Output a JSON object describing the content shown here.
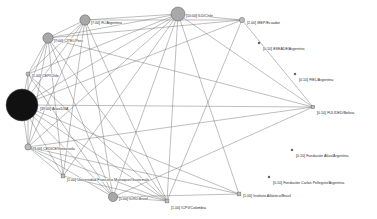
{
  "figure": {
    "title": "",
    "background_color": "#ffffff",
    "edge_color": "#6e6e6e",
    "node_fill_large": "#111111",
    "node_fill_medium": "#a8a8a8",
    "node_fill_small": "#bdbdbd",
    "node_stroke": "#5a5a5a",
    "label_color": "#2b2b2b"
  },
  "chart_data": {
    "type": "network",
    "title": "",
    "xlabel": "",
    "ylabel": "",
    "grid": false,
    "legend": "none",
    "node_size_metric": "weight",
    "nodes": [
      {
        "id": "atlas_usa",
        "label": "[39.00] Atlas/USA",
        "weight": 39.0,
        "x": 22,
        "y": 105,
        "r": 16.0,
        "shape": "circle",
        "fill": "#111111",
        "label_dx": 18,
        "label_dy": 5,
        "connected": true
      },
      {
        "id": "ild_chile",
        "label": "[10.00] ILD/Chile",
        "weight": 10.0,
        "x": 178,
        "y": 14,
        "r": 7.0,
        "shape": "circle",
        "fill": "#a8a8a8",
        "label_dx": 8,
        "label_dy": 2.5,
        "connected": true
      },
      {
        "id": "fl_argentina",
        "label": "[7.00] FL/Argentina",
        "weight": 7.0,
        "x": 85,
        "y": 20,
        "r": 5.2,
        "shape": "circle",
        "fill": "#a8a8a8",
        "label_dx": 6,
        "label_dy": 3.5,
        "connected": true
      },
      {
        "id": "citel_peru",
        "label": "[7.00] CITEL/Perú",
        "weight": 7.0,
        "x": 48,
        "y": 38,
        "r": 5.2,
        "shape": "circle",
        "fill": "#a8a8a8",
        "label_dx": 6,
        "label_dy": 3.5,
        "connected": true
      },
      {
        "id": "il_rj_brasil",
        "label": "[5.00] IL/RJ-Brasil",
        "weight": 5.0,
        "x": 113,
        "y": 197,
        "r": 4.6,
        "shape": "circle",
        "fill": "#a8a8a8",
        "label_dx": 6,
        "label_dy": 3.0,
        "connected": true
      },
      {
        "id": "cedice_ven",
        "label": "[3.00] CEDICE/Venezuela",
        "weight": 3.0,
        "x": 28,
        "y": 147,
        "r": 3.1,
        "shape": "circle",
        "fill": "#bdbdbd",
        "label_dx": 5,
        "label_dy": 3.0,
        "connected": true
      },
      {
        "id": "ieep_ecuador",
        "label": "[2.00] IEEP/Ecuador",
        "weight": 2.0,
        "x": 242,
        "y": 20,
        "r": 2.6,
        "shape": "circle",
        "fill": "#bdbdbd",
        "label_dx": 5,
        "label_dy": 4.0,
        "connected": true
      },
      {
        "id": "cep_chile",
        "label": "[1.00] CEP/Chile",
        "weight": 1.0,
        "x": 28,
        "y": 74,
        "r": 2.0,
        "shape": "circle",
        "fill": "#bdbdbd",
        "label_dx": 4,
        "label_dy": 3.0,
        "connected": true
      },
      {
        "id": "ufm_guatemala",
        "label": "[1.00] Universidad Francisco Marroquin/Guatemala",
        "weight": 1.0,
        "x": 63,
        "y": 176,
        "r": 1.9,
        "shape": "square",
        "fill": "#bdbdbd",
        "label_dx": 4,
        "label_dy": 4.5,
        "connected": true
      },
      {
        "id": "icpv_colombia",
        "label": "[1.00] ICPV/Colombia",
        "weight": 1.0,
        "x": 167,
        "y": 201,
        "r": 1.9,
        "shape": "square",
        "fill": "#bdbdbd",
        "label_dx": 4,
        "label_dy": 8.0,
        "connected": true
      },
      {
        "id": "inst_atl_bra",
        "label": "[1.00] Instituto Atlántico/Brasil",
        "weight": 1.0,
        "x": 239,
        "y": 194,
        "r": 1.9,
        "shape": "square",
        "fill": "#bdbdbd",
        "label_dx": 4,
        "label_dy": 3.0,
        "connected": true
      },
      {
        "id": "fulided_bol",
        "label": "[0.10] FULIDED/Bolivia",
        "weight": 0.1,
        "x": 313,
        "y": 107,
        "r": 1.7,
        "shape": "square",
        "fill": "#bdbdbd",
        "label_dx": 4,
        "label_dy": 6.5,
        "connected": true
      },
      {
        "id": "eseade_arg",
        "label": "[0.10] ESEADE/Argentina",
        "weight": 0.1,
        "x": 259,
        "y": 43,
        "r": 0.9,
        "shape": "square",
        "fill": "#555555",
        "label_dx": 4,
        "label_dy": 6.5,
        "connected": false
      },
      {
        "id": "fiel_arg",
        "label": "[0.10] FIEL/Argentina",
        "weight": 0.1,
        "x": 295,
        "y": 74,
        "r": 0.9,
        "shape": "square",
        "fill": "#555555",
        "label_dx": 4,
        "label_dy": 6.5,
        "connected": false
      },
      {
        "id": "fund_atlas_arg",
        "label": "[0.10] Fundación Atlas/Argentina",
        "weight": 0.1,
        "x": 292,
        "y": 150,
        "r": 0.9,
        "shape": "square",
        "fill": "#555555",
        "label_dx": 4,
        "label_dy": 6.5,
        "connected": false
      },
      {
        "id": "fund_carlos",
        "label": "[0.10] Fundación Carlos Pellegrini/Argentina",
        "weight": 0.1,
        "x": 269,
        "y": 177,
        "r": 0.9,
        "shape": "square",
        "fill": "#555555",
        "label_dx": 4,
        "label_dy": 6.5,
        "connected": false
      }
    ],
    "edges": [
      {
        "source": "atlas_usa",
        "target": "ild_chile"
      },
      {
        "source": "atlas_usa",
        "target": "fl_argentina"
      },
      {
        "source": "atlas_usa",
        "target": "citel_peru"
      },
      {
        "source": "atlas_usa",
        "target": "cep_chile"
      },
      {
        "source": "atlas_usa",
        "target": "cedice_ven"
      },
      {
        "source": "atlas_usa",
        "target": "il_rj_brasil"
      },
      {
        "source": "atlas_usa",
        "target": "ufm_guatemala"
      },
      {
        "source": "atlas_usa",
        "target": "icpv_colombia"
      },
      {
        "source": "atlas_usa",
        "target": "inst_atl_bra"
      },
      {
        "source": "atlas_usa",
        "target": "fulided_bol"
      },
      {
        "source": "atlas_usa",
        "target": "ieep_ecuador"
      },
      {
        "source": "ild_chile",
        "target": "fl_argentina"
      },
      {
        "source": "ild_chile",
        "target": "citel_peru"
      },
      {
        "source": "ild_chile",
        "target": "cep_chile"
      },
      {
        "source": "ild_chile",
        "target": "cedice_ven"
      },
      {
        "source": "ild_chile",
        "target": "il_rj_brasil"
      },
      {
        "source": "ild_chile",
        "target": "ufm_guatemala"
      },
      {
        "source": "ild_chile",
        "target": "icpv_colombia"
      },
      {
        "source": "ild_chile",
        "target": "inst_atl_bra"
      },
      {
        "source": "ild_chile",
        "target": "fulided_bol"
      },
      {
        "source": "ild_chile",
        "target": "ieep_ecuador"
      },
      {
        "source": "fl_argentina",
        "target": "citel_peru"
      },
      {
        "source": "fl_argentina",
        "target": "cep_chile"
      },
      {
        "source": "fl_argentina",
        "target": "cedice_ven"
      },
      {
        "source": "fl_argentina",
        "target": "il_rj_brasil"
      },
      {
        "source": "fl_argentina",
        "target": "ufm_guatemala"
      },
      {
        "source": "fl_argentina",
        "target": "icpv_colombia"
      },
      {
        "source": "fl_argentina",
        "target": "ieep_ecuador"
      },
      {
        "source": "citel_peru",
        "target": "cep_chile"
      },
      {
        "source": "citel_peru",
        "target": "cedice_ven"
      },
      {
        "source": "citel_peru",
        "target": "il_rj_brasil"
      },
      {
        "source": "citel_peru",
        "target": "ufm_guatemala"
      },
      {
        "source": "citel_peru",
        "target": "icpv_colombia"
      },
      {
        "source": "citel_peru",
        "target": "ieep_ecuador"
      },
      {
        "source": "citel_peru",
        "target": "fulided_bol"
      },
      {
        "source": "cep_chile",
        "target": "cedice_ven"
      },
      {
        "source": "cep_chile",
        "target": "il_rj_brasil"
      },
      {
        "source": "cep_chile",
        "target": "icpv_colombia"
      },
      {
        "source": "cedice_ven",
        "target": "il_rj_brasil"
      },
      {
        "source": "cedice_ven",
        "target": "ufm_guatemala"
      },
      {
        "source": "cedice_ven",
        "target": "icpv_colombia"
      },
      {
        "source": "cedice_ven",
        "target": "inst_atl_bra"
      },
      {
        "source": "il_rj_brasil",
        "target": "icpv_colombia"
      },
      {
        "source": "il_rj_brasil",
        "target": "inst_atl_bra"
      },
      {
        "source": "ufm_guatemala",
        "target": "icpv_colombia"
      },
      {
        "source": "ieep_ecuador",
        "target": "fulided_bol"
      },
      {
        "source": "ieep_ecuador",
        "target": "icpv_colombia"
      },
      {
        "source": "fulided_bol",
        "target": "il_rj_brasil"
      },
      {
        "source": "fulided_bol",
        "target": "cedice_ven"
      }
    ]
  }
}
